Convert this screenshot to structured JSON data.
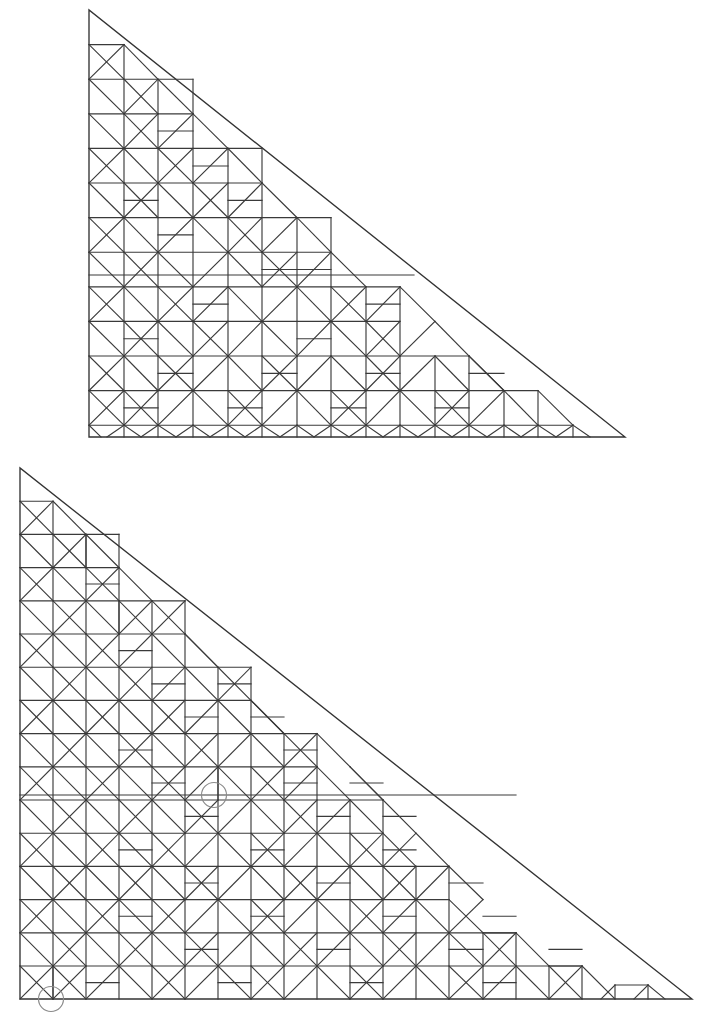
{
  "page": {
    "background_color": "#ffffff",
    "width": 711,
    "height": 1031
  },
  "style": {
    "line_color": "#3a3a3a",
    "outline_color": "#333333",
    "marker_color": "#8a8a8a",
    "line_width": 1.15
  },
  "figures": [
    {
      "id": "top-figure",
      "name": "upper-triangle-tiling",
      "shape": "right-triangle",
      "orientation": "right-angle-at-bottom-left",
      "apex": [
        89,
        10
      ],
      "bottom_left": [
        89,
        437
      ],
      "bottom_right": [
        625,
        437
      ],
      "grid": {
        "cell_width": 34.6,
        "cell_height": 34.6,
        "columns": 15.5,
        "rows": 12.35,
        "origin": [
          89,
          10
        ]
      },
      "markers": []
    },
    {
      "id": "bottom-figure",
      "name": "lower-triangle-tiling",
      "shape": "right-triangle",
      "orientation": "right-angle-at-bottom-left",
      "apex": [
        20,
        468
      ],
      "bottom_left": [
        20,
        999
      ],
      "bottom_right": [
        692,
        999
      ],
      "grid": {
        "cell_width": 33.2,
        "cell_height": 33.2,
        "columns": 20.2,
        "rows": 16,
        "origin": [
          20,
          468
        ]
      },
      "markers": [
        {
          "name": "marker-circle-upper",
          "cx": 214,
          "cy": 795,
          "r": 12.5
        },
        {
          "name": "marker-circle-lower",
          "cx": 51,
          "cy": 999,
          "r": 12.5
        }
      ]
    }
  ],
  "chart_data": {
    "type": "diagram",
    "figure_count": 2,
    "marker_count": 2
  }
}
